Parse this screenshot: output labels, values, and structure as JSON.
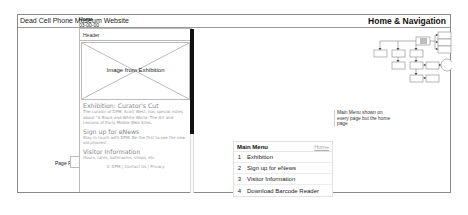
{
  "frame": {
    "site_title": "Dead Cell Phone Museum Website",
    "section_title": "Home & Navigation"
  },
  "screen": {
    "name": "Home",
    "id": "03-00-00"
  },
  "phone": {
    "header_label": "Header",
    "image_label": "Image from Exhibition",
    "sections": [
      {
        "heading": "Exhibition: Curator's Cut",
        "body": "The curator of DPM, Scott West, has special notes about \"A Black-and-White World: The Art and Lessons of Early Mobile Web Sites."
      },
      {
        "heading": "Sign up for eNews",
        "body": "Stay in touch with DPM. Be the first to see the new old phones!"
      },
      {
        "heading": "Visitor Information",
        "body": "Hours, rates, bathrooms, shops, etc."
      }
    ],
    "footer": "© DPM | Contact Us | Privacy"
  },
  "page_fold": {
    "label": "Page Fold"
  },
  "annotation": {
    "text": "Main Menu shown on every page but the home page"
  },
  "main_menu": {
    "title": "Main Menu",
    "home_link": "Home",
    "items": [
      {
        "num": "1",
        "label": "Exhibition"
      },
      {
        "num": "2",
        "label": "Sign up for eNews"
      },
      {
        "num": "3",
        "label": "Visitor Information"
      },
      {
        "num": "4",
        "label": "Download Barcode Reader"
      }
    ]
  },
  "colors": {
    "frame_border": "#8a8a8a",
    "scrollbar": "#111111",
    "highlight_node": "#bdbdbd",
    "muted_text": "#999999"
  }
}
